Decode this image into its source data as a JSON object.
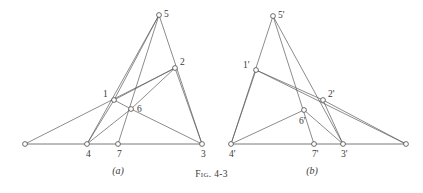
{
  "figure": {
    "caption_prefix": "Fig.",
    "caption_number": "4-3",
    "panels": [
      {
        "id": "a",
        "label": "(a)",
        "label_x": 118,
        "label_y": 174,
        "vertices": [
          {
            "id": "v0",
            "name": "left-anchor",
            "label": "",
            "x": 25,
            "y": 144,
            "label_dx": 0,
            "label_dy": 0
          },
          {
            "id": "v1",
            "name": "node-1",
            "label": "1",
            "x": 114,
            "y": 100,
            "label_dx": -11,
            "label_dy": -3
          },
          {
            "id": "v2",
            "name": "node-2",
            "label": "2",
            "x": 175,
            "y": 68,
            "label_dx": 5,
            "label_dy": -3
          },
          {
            "id": "v3",
            "name": "node-3",
            "label": "3",
            "x": 202,
            "y": 144,
            "label_dx": -1,
            "label_dy": 13
          },
          {
            "id": "v4",
            "name": "node-4",
            "label": "4",
            "x": 87,
            "y": 144,
            "label_dx": -1,
            "label_dy": 13
          },
          {
            "id": "v5",
            "name": "node-5",
            "label": "5",
            "x": 159,
            "y": 15,
            "label_dx": 5,
            "label_dy": 2
          },
          {
            "id": "v6",
            "name": "node-6",
            "label": "6",
            "x": 131,
            "y": 109,
            "label_dx": 6,
            "label_dy": 3
          },
          {
            "id": "v7",
            "name": "node-7",
            "label": "7",
            "x": 118,
            "y": 144,
            "label_dx": -1,
            "label_dy": 13
          }
        ],
        "edges": [
          {
            "from": "v0",
            "to": "v3",
            "kind": "baseline"
          },
          {
            "from": "v0",
            "to": "v2",
            "kind": "edge"
          },
          {
            "from": "v1",
            "to": "v4",
            "kind": "edge"
          },
          {
            "from": "v1",
            "to": "v5",
            "kind": "edge"
          },
          {
            "from": "v1",
            "to": "v2",
            "kind": "edge"
          },
          {
            "from": "v1",
            "to": "v6",
            "kind": "edge"
          },
          {
            "from": "v6",
            "to": "v4",
            "kind": "edge"
          },
          {
            "from": "v6",
            "to": "v3",
            "kind": "edge"
          },
          {
            "from": "v6",
            "to": "v2",
            "kind": "edge"
          },
          {
            "from": "v5",
            "to": "v4",
            "kind": "edge"
          },
          {
            "from": "v5",
            "to": "v7",
            "kind": "edge"
          },
          {
            "from": "v5",
            "to": "v3",
            "kind": "edge"
          },
          {
            "from": "v2",
            "to": "v3",
            "kind": "edge"
          }
        ]
      },
      {
        "id": "b",
        "label": "(b)",
        "label_x": 312,
        "label_y": 174,
        "vertices": [
          {
            "id": "w4",
            "name": "node-4-prime",
            "label": "4'",
            "x": 231,
            "y": 144,
            "label_dx": -2,
            "label_dy": 13
          },
          {
            "id": "w1",
            "name": "node-1-prime",
            "label": "1'",
            "x": 256,
            "y": 70,
            "label_dx": -13,
            "label_dy": -2
          },
          {
            "id": "w5",
            "name": "node-5-prime",
            "label": "5'",
            "x": 273,
            "y": 16,
            "label_dx": 5,
            "label_dy": 2
          },
          {
            "id": "w6",
            "name": "node-6-prime",
            "label": "6'",
            "x": 304,
            "y": 110,
            "label_dx": -5,
            "label_dy": 14
          },
          {
            "id": "w7",
            "name": "node-7-prime",
            "label": "7'",
            "x": 314,
            "y": 144,
            "label_dx": -2,
            "label_dy": 13
          },
          {
            "id": "w2",
            "name": "node-2-prime",
            "label": "2'",
            "x": 323,
            "y": 100,
            "label_dx": 5,
            "label_dy": -3
          },
          {
            "id": "w3",
            "name": "node-3-prime",
            "label": "3'",
            "x": 343,
            "y": 144,
            "label_dx": -2,
            "label_dy": 13
          },
          {
            "id": "w0",
            "name": "right-anchor",
            "label": "",
            "x": 406,
            "y": 144,
            "label_dx": 0,
            "label_dy": 0
          }
        ],
        "edges": [
          {
            "from": "w4",
            "to": "w0",
            "kind": "baseline"
          },
          {
            "from": "w5",
            "to": "w4",
            "kind": "edge"
          },
          {
            "from": "w5",
            "to": "w7",
            "kind": "edge"
          },
          {
            "from": "w5",
            "to": "w3",
            "kind": "edge"
          },
          {
            "from": "w1",
            "to": "w2",
            "kind": "edge"
          },
          {
            "from": "w1",
            "to": "w0",
            "kind": "edge"
          },
          {
            "from": "w1",
            "to": "w4",
            "kind": "edge"
          },
          {
            "from": "w6",
            "to": "w4",
            "kind": "edge"
          },
          {
            "from": "w6",
            "to": "w3",
            "kind": "edge"
          },
          {
            "from": "w2",
            "to": "w3",
            "kind": "edge"
          },
          {
            "from": "w2",
            "to": "w0",
            "kind": "edge"
          }
        ]
      }
    ]
  }
}
